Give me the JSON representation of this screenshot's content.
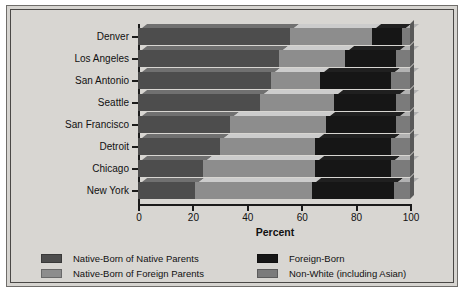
{
  "chart_data": {
    "type": "bar",
    "orientation": "horizontal",
    "stacked": true,
    "title": "",
    "xlabel": "Percent",
    "ylabel": "",
    "xlim": [
      0,
      100
    ],
    "xticks": [
      0,
      20,
      40,
      60,
      80,
      100
    ],
    "grid": false,
    "legend_position": "bottom",
    "categories": [
      "Denver",
      "Los Angeles",
      "San Antonio",
      "Seattle",
      "San Francisco",
      "Detroit",
      "Chicago",
      "New York"
    ],
    "series": [
      {
        "name": "Native-Born of Native Parents",
        "color": "#4d4d4d",
        "values": [
          56,
          52,
          49,
          45,
          34,
          30,
          24,
          21
        ]
      },
      {
        "name": "Native-Born of Foreign Parents",
        "color": "#8d8d8d",
        "values": [
          30,
          24,
          18,
          27,
          35,
          35,
          41,
          43
        ]
      },
      {
        "name": "Foreign-Born",
        "color": "#161616",
        "values": [
          11,
          19,
          26,
          23,
          26,
          28,
          28,
          30
        ]
      },
      {
        "name": "Non-White (including Asian)",
        "color": "#7b7b7b",
        "values": [
          3,
          5,
          7,
          5,
          5,
          7,
          7,
          6
        ]
      }
    ]
  },
  "legend": {
    "items": [
      {
        "label": "Native-Born of Native Parents",
        "color": "#4d4d4d"
      },
      {
        "label": "Native-Born of Foreign Parents",
        "color": "#8d8d8d"
      },
      {
        "label": "Foreign-Born",
        "color": "#161616"
      },
      {
        "label": "Non-White (including Asian)",
        "color": "#7b7b7b"
      }
    ]
  }
}
